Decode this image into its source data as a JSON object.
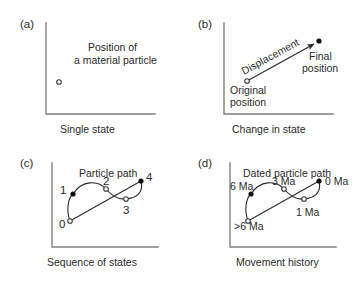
{
  "figure": {
    "width": 356,
    "height": 282,
    "background": "#ffffff",
    "axis_color": "#808080",
    "ink_color": "#2b2b2b"
  },
  "panels": [
    {
      "key": "a",
      "label": "(a)",
      "caption": "Single state",
      "annotations": [
        {
          "name": "position-line-1",
          "text": "Position of"
        },
        {
          "name": "position-line-2",
          "text": "a material particle"
        }
      ],
      "markers": [
        {
          "name": "particle-marker",
          "kind": "open",
          "x": 59,
          "y": 82
        }
      ]
    },
    {
      "key": "b",
      "label": "(b)",
      "caption": "Change in state",
      "annotations": [
        {
          "name": "displacement-label",
          "text": "Displacement"
        },
        {
          "name": "original-position-line-1",
          "text": "Original"
        },
        {
          "name": "original-position-line-2",
          "text": "position"
        },
        {
          "name": "final-position-line-1",
          "text": "Final"
        },
        {
          "name": "final-position-line-2",
          "text": "position"
        }
      ],
      "vector": {
        "x1": 247,
        "y1": 81,
        "x2": 316,
        "y2": 43
      },
      "markers": [
        {
          "name": "original-position-marker",
          "kind": "open",
          "x": 247,
          "y": 81
        },
        {
          "name": "final-position-marker",
          "kind": "filled",
          "x": 319,
          "y": 41
        }
      ]
    },
    {
      "key": "c",
      "label": "(c)",
      "caption": "Sequence of states",
      "title": "Particle path",
      "nodes": [
        {
          "name": "node-0",
          "text": "0",
          "kind": "open",
          "x": 70,
          "y": 221
        },
        {
          "name": "node-1",
          "text": "1",
          "kind": "filled",
          "x": 73,
          "y": 194
        },
        {
          "name": "node-2",
          "text": "2",
          "kind": "open",
          "x": 106,
          "y": 189
        },
        {
          "name": "node-3",
          "text": "3",
          "kind": "open",
          "x": 126,
          "y": 199
        },
        {
          "name": "node-4",
          "text": "4",
          "kind": "filled",
          "x": 141,
          "y": 181
        }
      ]
    },
    {
      "key": "d",
      "label": "(d)",
      "caption": "Movement history",
      "title": "Dated particle path",
      "nodes": [
        {
          "name": "node-gt6ma",
          "text": ">6 Ma",
          "kind": "open",
          "x": 248,
          "y": 221
        },
        {
          "name": "node-6ma",
          "text": "6 Ma",
          "kind": "filled",
          "x": 251,
          "y": 194
        },
        {
          "name": "node-3ma",
          "text": "3 Ma",
          "kind": "open",
          "x": 284,
          "y": 189
        },
        {
          "name": "node-1ma",
          "text": "1 Ma",
          "kind": "open",
          "x": 304,
          "y": 199
        },
        {
          "name": "node-0ma",
          "text": "0 Ma",
          "kind": "filled",
          "x": 319,
          "y": 181
        }
      ]
    }
  ]
}
